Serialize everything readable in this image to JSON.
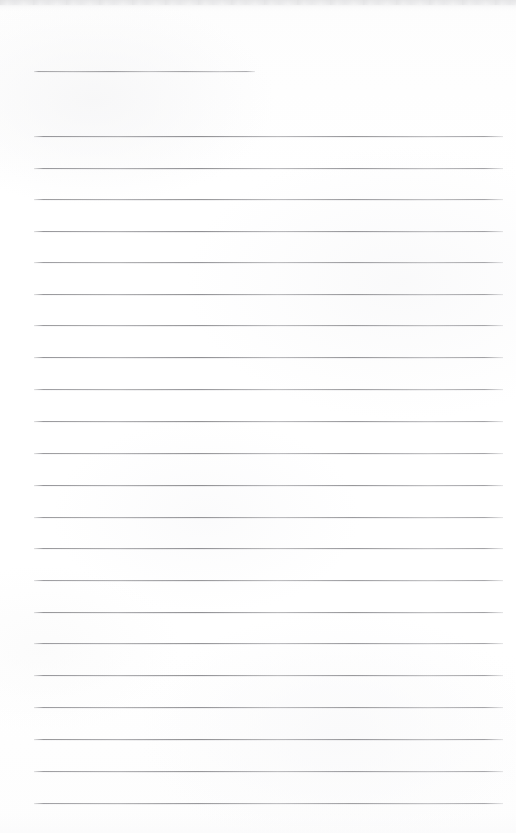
{
  "document": {
    "kind": "scanned-lined-notepad-page",
    "page_label": "",
    "page_text": "",
    "background_color": "#ffffff",
    "rule_color": "#8a8a8e",
    "scan_edge_color": "#e4e4e5",
    "page_width": 516,
    "page_height": 833
  },
  "ruling": {
    "line_count": 24,
    "left_x": 34,
    "right_x": 503,
    "spacing": 31.6,
    "first_line_is_short": true,
    "short_line_right_x": 255,
    "lines": [
      {
        "index": 1,
        "y": 71,
        "x1": 34,
        "x2": 255,
        "opacity": 0.8
      },
      {
        "index": 2,
        "y": 136,
        "x1": 34,
        "x2": 503,
        "opacity": 0.92
      },
      {
        "index": 3,
        "y": 168,
        "x1": 34,
        "x2": 503,
        "opacity": 0.9
      },
      {
        "index": 4,
        "y": 199,
        "x1": 34,
        "x2": 503,
        "opacity": 0.88
      },
      {
        "index": 5,
        "y": 231,
        "x1": 34,
        "x2": 503,
        "opacity": 0.92
      },
      {
        "index": 6,
        "y": 262,
        "x1": 34,
        "x2": 503,
        "opacity": 0.86
      },
      {
        "index": 7,
        "y": 294,
        "x1": 34,
        "x2": 503,
        "opacity": 0.9
      },
      {
        "index": 8,
        "y": 325,
        "x1": 34,
        "x2": 503,
        "opacity": 0.88
      },
      {
        "index": 9,
        "y": 357,
        "x1": 34,
        "x2": 503,
        "opacity": 0.92
      },
      {
        "index": 10,
        "y": 389,
        "x1": 34,
        "x2": 503,
        "opacity": 0.86
      },
      {
        "index": 11,
        "y": 421,
        "x1": 34,
        "x2": 503,
        "opacity": 0.9
      },
      {
        "index": 12,
        "y": 453,
        "x1": 34,
        "x2": 503,
        "opacity": 0.88
      },
      {
        "index": 13,
        "y": 485,
        "x1": 34,
        "x2": 503,
        "opacity": 0.92
      },
      {
        "index": 14,
        "y": 517,
        "x1": 34,
        "x2": 503,
        "opacity": 0.88
      },
      {
        "index": 15,
        "y": 548,
        "x1": 34,
        "x2": 503,
        "opacity": 0.9
      },
      {
        "index": 16,
        "y": 580,
        "x1": 34,
        "x2": 503,
        "opacity": 0.86
      },
      {
        "index": 17,
        "y": 612,
        "x1": 34,
        "x2": 503,
        "opacity": 0.92
      },
      {
        "index": 18,
        "y": 643,
        "x1": 34,
        "x2": 503,
        "opacity": 0.88
      },
      {
        "index": 19,
        "y": 675,
        "x1": 34,
        "x2": 503,
        "opacity": 0.9
      },
      {
        "index": 20,
        "y": 707,
        "x1": 34,
        "x2": 503,
        "opacity": 0.88
      },
      {
        "index": 21,
        "y": 739,
        "x1": 34,
        "x2": 503,
        "opacity": 0.92
      },
      {
        "index": 22,
        "y": 771,
        "x1": 34,
        "x2": 503,
        "opacity": 0.86
      },
      {
        "index": 23,
        "y": 803,
        "x1": 34,
        "x2": 503,
        "opacity": 0.84
      }
    ]
  }
}
